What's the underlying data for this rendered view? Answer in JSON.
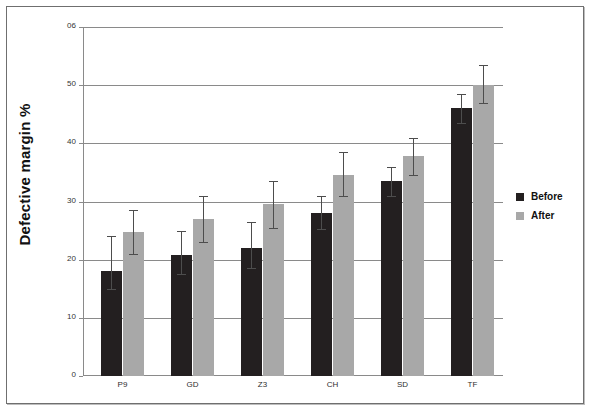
{
  "chart_data": {
    "type": "bar",
    "title": "",
    "xlabel": "",
    "ylabel": "Defective margin %",
    "categories": [
      "P9",
      "GD",
      "Z3",
      "CH",
      "SD",
      "TF"
    ],
    "ylim": [
      0,
      60
    ],
    "yticks": [
      0,
      10,
      20,
      30,
      40,
      50,
      60
    ],
    "ytick_labels": [
      "0",
      "10",
      "20",
      "30",
      "40",
      "50",
      "06"
    ],
    "grid": "horizontal",
    "legend_position": "right",
    "series": [
      {
        "name": "Before",
        "color": "#231f20",
        "values": [
          18.0,
          20.8,
          22.0,
          28.0,
          33.5,
          46.0
        ],
        "err_low": [
          15.0,
          17.5,
          18.5,
          25.3,
          31.0,
          43.5
        ],
        "err_high": [
          24.0,
          25.0,
          26.5,
          31.0,
          36.0,
          48.5
        ]
      },
      {
        "name": "After",
        "color": "#a8a8a8",
        "values": [
          24.8,
          27.0,
          29.5,
          34.5,
          37.8,
          50.0
        ],
        "err_low": [
          21.0,
          23.0,
          25.5,
          31.0,
          34.5,
          47.0
        ],
        "err_high": [
          28.5,
          31.0,
          33.5,
          38.5,
          41.0,
          53.5
        ]
      }
    ]
  },
  "legend": {
    "items": [
      {
        "label": "Before",
        "color": "#231f20"
      },
      {
        "label": "After",
        "color": "#a8a8a8"
      }
    ]
  },
  "axis": {
    "y_title": "Defective margin %"
  }
}
